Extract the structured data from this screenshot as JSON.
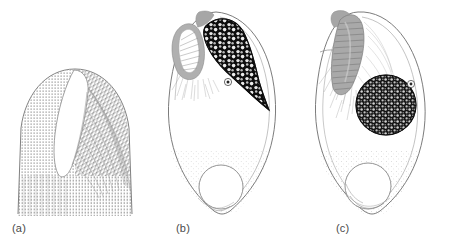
{
  "figure": {
    "width": 454,
    "height": 246,
    "background_color": "#ffffff",
    "type": "scientific-line-drawing"
  },
  "colors": {
    "outline": "#6b6b6b",
    "outline_dark": "#4d4d4d",
    "stipple": "#8a8a8a",
    "hatch": "#9a9a9a",
    "dark_body": "#111111",
    "gray_lobe": "#a8a8a8",
    "gray_lobe_dark": "#8d8d8d",
    "label_text": "#4a4a4a",
    "white_fill": "#ffffff"
  },
  "panels": [
    {
      "id": "a",
      "label": "(a)",
      "label_x": 12,
      "label_y": 224,
      "origin_x": 0,
      "title": "dome-shaped apical structure with longitudinal groove",
      "features": [
        {
          "name": "dome-outline",
          "shape": "bullet-dome"
        },
        {
          "name": "longitudinal-groove",
          "shape": "elongated-white-slit"
        },
        {
          "name": "stipple-texture-left",
          "shape": "dense-stipple"
        },
        {
          "name": "hatch-texture-right",
          "shape": "curved-hatch-lines"
        }
      ]
    },
    {
      "id": "b",
      "label": "(b)",
      "label_x": 176,
      "label_y": 224,
      "origin_x": 150,
      "title": "ovoid cell with dark reticulate crescent body and gray lobe",
      "features": [
        {
          "name": "cell-outline",
          "shape": "ovoid-teardrop"
        },
        {
          "name": "dark-reticulate-body",
          "shape": "tapered-crescent"
        },
        {
          "name": "gray-lobe",
          "shape": "fan-striated-oval"
        },
        {
          "name": "nucleolus-pore",
          "shape": "small-circle"
        },
        {
          "name": "basal-vacuole",
          "shape": "circle"
        },
        {
          "name": "apical-tip",
          "shape": "small-gray-cap"
        },
        {
          "name": "basal-stipple",
          "shape": "sparse-stipple"
        }
      ]
    },
    {
      "id": "c",
      "label": "(c)",
      "label_x": 336,
      "label_y": 224,
      "origin_x": 300,
      "title": "ovoid cell with round granular nucleus and curved striated apical rod",
      "features": [
        {
          "name": "cell-outline",
          "shape": "ovoid-teardrop"
        },
        {
          "name": "granular-nucleus",
          "shape": "dark-stippled-circle"
        },
        {
          "name": "striated-apical-rod",
          "shape": "curved-banded-gray-rod"
        },
        {
          "name": "nucleolus-pore",
          "shape": "small-circle"
        },
        {
          "name": "basal-vacuole",
          "shape": "circle"
        },
        {
          "name": "radiating-hatch",
          "shape": "fine-radiating-lines"
        },
        {
          "name": "basal-stipple",
          "shape": "sparse-stipple"
        }
      ]
    }
  ]
}
